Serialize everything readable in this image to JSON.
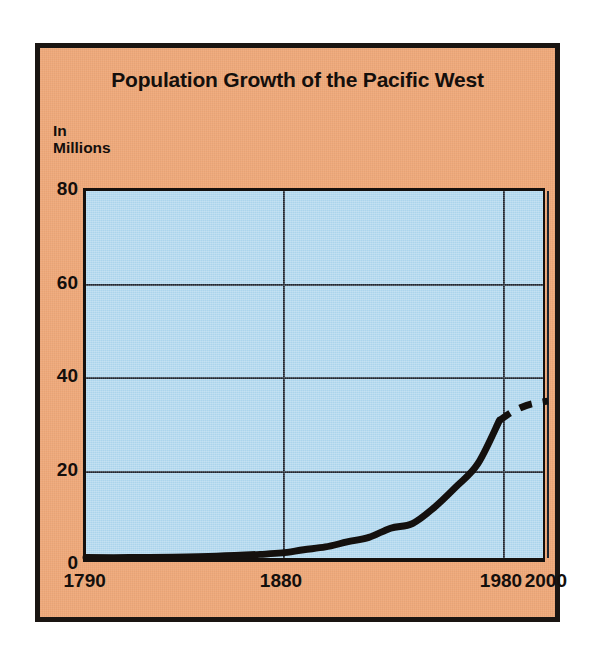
{
  "figure": {
    "title": "Population Growth of the Pacific West",
    "y_axis_caption_line1": "In",
    "y_axis_caption_line2": "Millions",
    "background_color": "#EFA97A",
    "plot_fill_color": "#ABD4EC",
    "line_color": "#14100E",
    "grid_color": "#1D2530"
  },
  "chart_data": {
    "type": "line",
    "title": "Population Growth of the Pacific West",
    "xlabel": "",
    "ylabel": "In Millions",
    "ylim": [
      0,
      80
    ],
    "xlim": [
      1790,
      2000
    ],
    "grid": true,
    "legend": "none",
    "y_ticks": [
      0,
      20,
      40,
      60,
      80
    ],
    "y_tick_labels": [
      "0",
      "20",
      "40",
      "60",
      "80"
    ],
    "x_ticks": [
      1790,
      1880,
      1980,
      2000
    ],
    "x_tick_labels": [
      "1790",
      "1880",
      "1980",
      "2000"
    ],
    "annotations": [
      "Solid line shows recorded population 1790-1980",
      "Dashed line shows projected population 1980-2000"
    ],
    "series": [
      {
        "name": "Recorded population",
        "style": "solid",
        "x": [
          1790,
          1810,
          1830,
          1850,
          1870,
          1880,
          1890,
          1900,
          1910,
          1920,
          1930,
          1940,
          1950,
          1960,
          1970,
          1980
        ],
        "values": [
          0.1,
          0.1,
          0.2,
          0.4,
          0.8,
          1.1,
          1.8,
          2.4,
          3.5,
          4.5,
          6.5,
          7.5,
          11.0,
          15.5,
          20.5,
          30.0
        ]
      },
      {
        "name": "Projected population",
        "style": "dashed",
        "x": [
          1980,
          1985,
          1990,
          1995,
          2000
        ],
        "values": [
          30.0,
          31.6,
          32.8,
          33.6,
          34.2
        ]
      }
    ]
  }
}
